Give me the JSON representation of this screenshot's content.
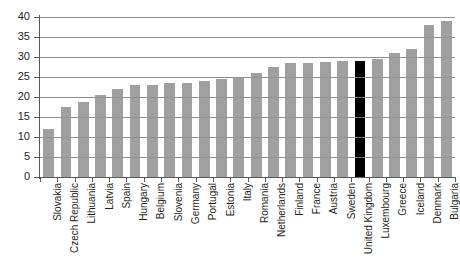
{
  "chart_data": {
    "type": "bar",
    "title": "",
    "xlabel": "",
    "ylabel": "",
    "ylim": [
      0,
      40
    ],
    "yticks": [
      0,
      5,
      10,
      15,
      20,
      25,
      30,
      35,
      40
    ],
    "grid": true,
    "legend": "none",
    "highlight_category": "United Kingdom",
    "bar_color": "#a0a0a0",
    "highlight_color": "#000000",
    "categories": [
      "Slovakia",
      "Czech Republic",
      "Lithuania",
      "Latvia",
      "Spain",
      "Hungary",
      "Belgium",
      "Slovenia",
      "Germany",
      "Portugal",
      "Estonia",
      "Italy",
      "Romania",
      "Netherlands",
      "Finland",
      "France",
      "Austria",
      "Sweden",
      "United Kingdom",
      "Luxembourg",
      "Greece",
      "Iceland",
      "Denmark",
      "Bulgaria"
    ],
    "values": [
      12.0,
      17.5,
      18.8,
      20.5,
      22.0,
      23.0,
      23.0,
      23.5,
      23.5,
      24.0,
      24.5,
      24.8,
      26.0,
      27.5,
      28.5,
      28.5,
      28.8,
      29.0,
      29.0,
      29.5,
      31.0,
      32.0,
      38.0,
      39.0
    ]
  }
}
